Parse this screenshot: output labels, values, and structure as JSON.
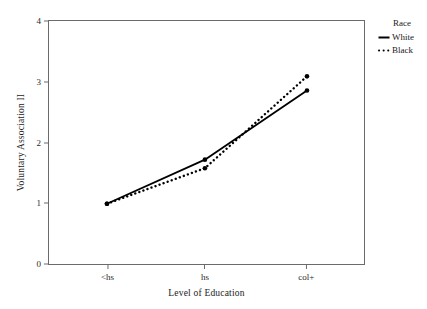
{
  "chart_data": {
    "type": "line",
    "title": "",
    "subtitle": "",
    "xlabel": "Level of Education",
    "ylabel": "Voluntary Association II",
    "categories": [
      "<hs",
      "hs",
      "col+"
    ],
    "series": [
      {
        "name": "White",
        "values": [
          1.0,
          1.72,
          2.85
        ],
        "style": "solid",
        "marker": "dot",
        "color": "#000000"
      },
      {
        "name": "Black",
        "values": [
          1.0,
          1.58,
          3.08
        ],
        "style": "dotted",
        "marker": "dot",
        "color": "#000000"
      }
    ],
    "ylim": [
      0,
      4
    ],
    "y_ticks": [
      0,
      1,
      2,
      3,
      4
    ],
    "y_tick_labels": [
      "0",
      "1",
      "2",
      "3",
      "4"
    ],
    "x_ticks": [
      "<hs",
      "hs",
      "col+"
    ],
    "grid": false,
    "legend_position": "right",
    "legend_title": "Race"
  },
  "axes": {
    "y": {
      "title": "Voluntary Association II",
      "ticks": [
        {
          "label": "4",
          "value": 4
        },
        {
          "label": "3",
          "value": 3
        },
        {
          "label": "2",
          "value": 2
        },
        {
          "label": "1",
          "value": 1
        },
        {
          "label": "0",
          "value": 0
        }
      ]
    },
    "x": {
      "title": "Level of Education",
      "ticks": [
        {
          "label": "<hs"
        },
        {
          "label": "hs"
        },
        {
          "label": "col+"
        }
      ]
    }
  },
  "legend": {
    "title": "Race",
    "entries": [
      {
        "label": "White",
        "style": "solid"
      },
      {
        "label": "Black",
        "style": "dotted"
      }
    ]
  },
  "colors": {
    "line": "#000000",
    "frame": "#6b6b6b",
    "text": "#1a1a1a",
    "background": "#ffffff"
  }
}
